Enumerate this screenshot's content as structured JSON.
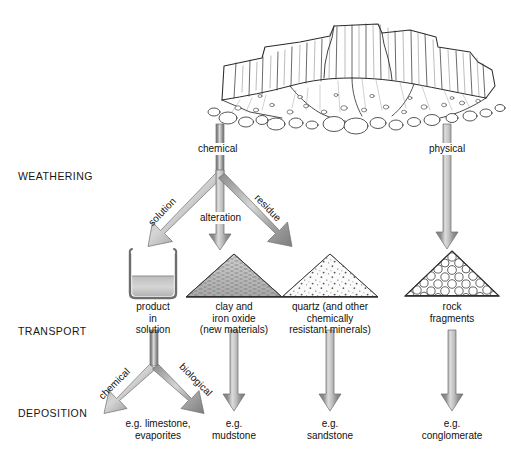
{
  "diagram": {
    "stage_labels": [
      {
        "id": "weathering",
        "text": "WEATHERING"
      },
      {
        "id": "transport",
        "text": "TRANSPORT"
      },
      {
        "id": "deposition",
        "text": "DEPOSITION"
      }
    ],
    "source_illustration": {
      "name": "rock-outcrop-with-scree-and-boulders"
    },
    "arrow_labels": {
      "chemical_top": "chemical",
      "physical_top": "physical",
      "solution": "solution",
      "alteration": "alteration",
      "residue": "residue",
      "chemical_transport": "chemical",
      "biological_transport": "biological"
    },
    "products": [
      {
        "id": "solution",
        "icon": "beaker-icon",
        "label": "product\nin\nsolution"
      },
      {
        "id": "clay",
        "icon": "clay-pile-icon",
        "label": "clay and\niron oxide\n(new materials)"
      },
      {
        "id": "quartz",
        "icon": "quartz-pile-icon",
        "label": "quartz (and other\nchemically\nresistant minerals)"
      },
      {
        "id": "rock-fragments",
        "icon": "pebble-pile-icon",
        "label": "rock\nfragments"
      }
    ],
    "deposits": [
      {
        "id": "limestone",
        "label": "e.g. limestone,\nevaporites"
      },
      {
        "id": "mudstone",
        "label": "e.g.\nmudstone"
      },
      {
        "id": "sandstone",
        "label": "e.g.\nsandstone"
      },
      {
        "id": "conglomerate",
        "label": "e.g.\nconglomerate"
      }
    ],
    "colors": {
      "background": "#ffffff",
      "ink": "#111111",
      "arrow_dark": "#8c8c8c",
      "arrow_light": "#d2d2d2",
      "arrow_edge": "#6f6f6f",
      "clay_fill": "#b9b9b9",
      "quartz_fill": "#f4f4f4",
      "liquid_fill": "#c9c9c9"
    }
  }
}
